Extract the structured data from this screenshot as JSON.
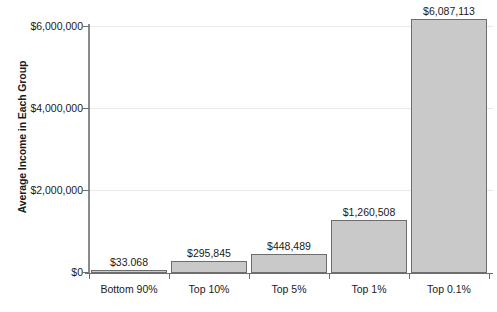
{
  "chart_data": {
    "type": "bar",
    "title": "",
    "xlabel": "",
    "ylabel": "Average Income in Each Group",
    "categories": [
      "Bottom 90%",
      "Top 10%",
      "Top 5%",
      "Top 1%",
      "Top 0.1%"
    ],
    "values": [
      33068,
      295845,
      448489,
      1260508,
      6087113
    ],
    "value_labels": [
      "$33.068",
      "$295,845",
      "$448,489",
      "$1,260,508",
      "$6,087,113"
    ],
    "ylim": [
      0,
      6000000
    ],
    "y_ticks": [
      0,
      2000000,
      4000000,
      6000000
    ],
    "y_tick_labels": [
      "$0",
      "$2,000,000",
      "$4,000,000",
      "$6,000,000"
    ],
    "grid": true,
    "legend": null,
    "bar_fill_color": "#c9c9c9",
    "bar_border_color": "#6d6d6d",
    "gridline_color": "#e9e9e9",
    "axis_color": "#6e6e6e",
    "background_color": "#ffffff"
  }
}
